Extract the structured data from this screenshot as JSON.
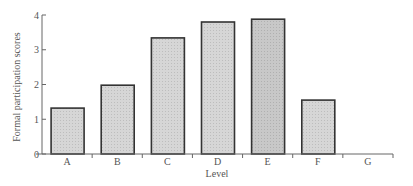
{
  "chart_data": {
    "type": "bar",
    "title": "",
    "xlabel": "Level",
    "ylabel": "Formal participation scores",
    "categories": [
      "A",
      "B",
      "C",
      "D",
      "E",
      "F",
      "G"
    ],
    "values": [
      1.32,
      1.98,
      3.34,
      3.8,
      3.88,
      1.55,
      0
    ],
    "ylim": [
      0,
      4
    ],
    "yticks": [
      0,
      1,
      2,
      3,
      4
    ],
    "grid": false,
    "legend": null,
    "bar_colors": [
      "#d9d9d9",
      "#d9d9d9",
      "#d9d9d9",
      "#d9d9d9",
      "#c9c9c9",
      "#d9d9d9",
      "#d9d9d9"
    ],
    "bar_edge_color": "#333333"
  }
}
